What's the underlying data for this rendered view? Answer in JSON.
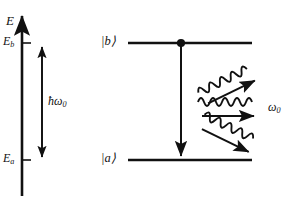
{
  "figure": {
    "kind": "energy-level-diagram",
    "line_color": "#111111",
    "background": "#ffffff"
  },
  "axis": {
    "name": "energy-axis",
    "label": "E",
    "direction": "up",
    "x": 22,
    "top_y": 14,
    "bottom_y": 196,
    "ticks": [
      {
        "label": "E",
        "sub": "b",
        "y": 43
      },
      {
        "label": "E",
        "sub": "a",
        "y": 160
      }
    ]
  },
  "energy_gap": {
    "name": "photon-energy-gap",
    "label": "ħω",
    "sub": "0",
    "arrow": "double-headed",
    "x": 42,
    "top_y": 46,
    "bottom_y": 158
  },
  "levels": [
    {
      "name": "level-b",
      "label": "|b⟩",
      "y": 43,
      "x_start": 128,
      "x_end": 252,
      "label_x": 104,
      "occupied": true,
      "dot_x": 181
    },
    {
      "name": "level-a",
      "label": "|a⟩",
      "y": 160,
      "x_start": 128,
      "x_end": 252,
      "label_x": 104,
      "occupied": false
    }
  ],
  "transition": {
    "name": "emission-transition",
    "direction": "down",
    "x": 181,
    "from_y": 46,
    "to_y": 157
  },
  "photons": {
    "name": "emitted-photons",
    "label": "ω",
    "sub": "0",
    "label_x": 270,
    "label_y": 108,
    "waves": [
      {
        "name": "photon-wave-up",
        "angle": -26,
        "cx": 232,
        "cy": 84
      },
      {
        "name": "photon-wave-middle",
        "angle": 0,
        "cx": 232,
        "cy": 109
      },
      {
        "name": "photon-wave-down",
        "angle": 26,
        "cx": 232,
        "cy": 136
      }
    ]
  }
}
